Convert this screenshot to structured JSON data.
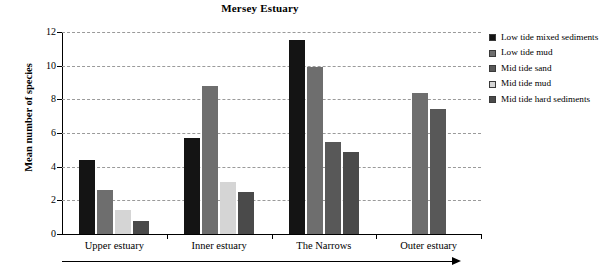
{
  "chart_data": {
    "type": "bar",
    "title": "Mersey Estuary",
    "xlabel": "",
    "ylabel": "Mean number of species",
    "ylim": [
      0,
      12
    ],
    "ytick_values": [
      0,
      2,
      4,
      6,
      8,
      10,
      12
    ],
    "ytick_labels": [
      "0",
      "2",
      "4",
      "6",
      "8",
      "10",
      "12"
    ],
    "grid": true,
    "legend_position": "right",
    "categories": [
      "Upper estuary",
      "Inner estuary",
      "The Narrows",
      "Outer estuary"
    ],
    "series": [
      {
        "name": "Low tide mixed sediments",
        "color": "#141414",
        "values": [
          4.4,
          5.7,
          11.5,
          null
        ]
      },
      {
        "name": "Low tide mud",
        "color": "#6e6e6e",
        "values": [
          2.6,
          8.8,
          9.95,
          8.35
        ]
      },
      {
        "name": "Mid tide sand",
        "color": "#585858",
        "values": [
          null,
          null,
          5.45,
          7.45
        ]
      },
      {
        "name": "Mid tide mud",
        "color": "#d5d5d5",
        "values": [
          1.45,
          3.1,
          null,
          null
        ]
      },
      {
        "name": "Mid tide hard sediments",
        "color": "#4a4a4a",
        "values": [
          0.8,
          2.5,
          4.9,
          null
        ]
      }
    ],
    "annotations": [
      {
        "name": "seaward-direction-arrow",
        "description": "horizontal arrow below x-axis pointing right"
      }
    ]
  },
  "legend": {
    "items": [
      {
        "label": "Low tide mixed sediments",
        "color": "#141414"
      },
      {
        "label": "Low tide mud",
        "color": "#6e6e6e"
      },
      {
        "label": "Mid tide sand",
        "color": "#585858"
      },
      {
        "label": "Mid tide mud",
        "color": "#d5d5d5"
      },
      {
        "label": "Mid tide hard sediments",
        "color": "#4a4a4a"
      }
    ]
  }
}
